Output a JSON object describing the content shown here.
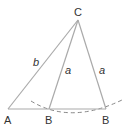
{
  "diagram": {
    "stroke_color": "#aaaaaa",
    "text_color": "#333333",
    "points": {
      "A": {
        "label": "A",
        "x": 8,
        "y": 109
      },
      "B1": {
        "label": "B",
        "x": 49,
        "y": 109
      },
      "B2": {
        "label": "B",
        "x": 106,
        "y": 109
      },
      "C": {
        "label": "C",
        "x": 78,
        "y": 20
      }
    },
    "sides": {
      "AC": {
        "label": "b"
      },
      "CB1": {
        "label": "a"
      },
      "CB2": {
        "label": "a"
      }
    },
    "arc": {
      "style": "dashed",
      "center": "C",
      "radius_label": "a"
    }
  }
}
